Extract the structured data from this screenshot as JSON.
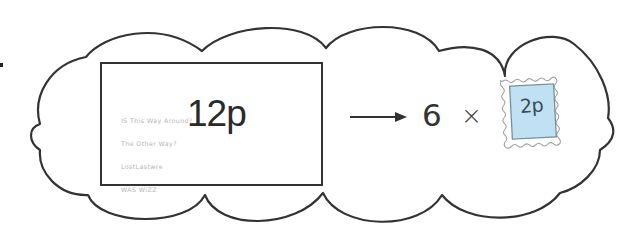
{
  "diagram": {
    "type": "money-equivalence-illustration",
    "envelope": {
      "value_label": "12p",
      "address_lines": [
        "IS This Way Around?",
        "The Other Way?",
        "LostLastwre",
        "WAS WiZZ"
      ]
    },
    "arrow_icon": "right-arrow-icon",
    "equation": {
      "multiplier": "6",
      "operator": "×"
    },
    "stamp": {
      "value_label": "2p",
      "fill_color": "#bfe1f3",
      "border_color": "#7c8f99",
      "perforation_color": "#9a9a9a"
    },
    "colors": {
      "outline": "#333333",
      "background": "#ffffff",
      "address_text": "#b5b5b5"
    }
  }
}
